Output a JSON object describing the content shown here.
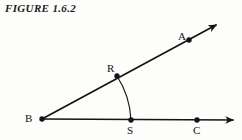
{
  "figure": {
    "caption": "FIGURE 1.6.2",
    "background_color": "#fdfdfb",
    "ink_color": "#141414"
  },
  "geometry": {
    "vertex": {
      "label": "B",
      "x": 42,
      "y": 119
    },
    "rays": [
      {
        "name": "ray-BA",
        "from": "B",
        "through": "A",
        "arrowhead": true,
        "start": {
          "x": 42,
          "y": 119
        },
        "end": {
          "x": 216,
          "y": 25
        }
      },
      {
        "name": "ray-BC",
        "from": "B",
        "through": "C",
        "arrowhead": true,
        "start": {
          "x": 42,
          "y": 119
        },
        "end": {
          "x": 233,
          "y": 120
        }
      }
    ],
    "points": [
      {
        "label": "A",
        "x": 189,
        "y": 40,
        "on": "ray-BA"
      },
      {
        "label": "R",
        "x": 117,
        "y": 76,
        "on": "ray-BA"
      },
      {
        "label": "B",
        "x": 42,
        "y": 119,
        "on": "vertex"
      },
      {
        "label": "S",
        "x": 131,
        "y": 120,
        "on": "ray-BC"
      },
      {
        "label": "C",
        "x": 197,
        "y": 120,
        "on": "ray-BC"
      }
    ],
    "angle_arc": {
      "name": "angle-arc-RS",
      "center": "B",
      "from_point": "R",
      "to_point": "S",
      "radius": 89
    }
  }
}
